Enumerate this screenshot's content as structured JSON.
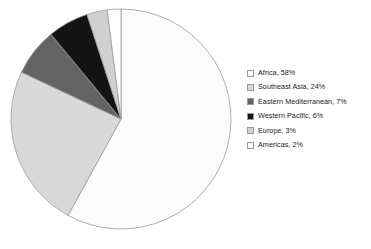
{
  "chart_data": {
    "type": "pie",
    "title": "",
    "subtitle": "",
    "xlabel": "",
    "ylabel": "",
    "legend_position": "right",
    "grid": false,
    "start_angle_deg": 0,
    "direction": "clockwise",
    "categories": [
      "Africa",
      "Southeast Asia",
      "Eastern Mediterranean",
      "Western Pacific",
      "Europe",
      "Americas"
    ],
    "values": [
      58,
      24,
      7,
      6,
      3,
      2
    ],
    "value_unit": "%",
    "slice_colors": [
      "#fbfbfb",
      "#d9d9d9",
      "#636363",
      "#141414",
      "#d0d0d0",
      "#ffffff"
    ],
    "slice_outline_color": "#9a9a9a",
    "slices": [
      {
        "label": "Africa",
        "value": 58,
        "display": "Africa, 58%",
        "color": "#fbfbfb"
      },
      {
        "label": "Southeast Asia",
        "value": 24,
        "display": "Southeast Asia, 24%",
        "color": "#d9d9d9"
      },
      {
        "label": "Eastern Mediterranean",
        "value": 7,
        "display": "Eastern Mediterranean, 7%",
        "color": "#636363"
      },
      {
        "label": "Western Pacific",
        "value": 6,
        "display": "Western Pacific, 6%",
        "color": "#141414"
      },
      {
        "label": "Europe",
        "value": 3,
        "display": "Europe, 3%",
        "color": "#d0d0d0"
      },
      {
        "label": "Americas",
        "value": 2,
        "display": "Americas, 2%",
        "color": "#ffffff"
      }
    ]
  },
  "legend": {
    "items": [
      {
        "label": "Africa, 58%",
        "color": "#fbfbfb"
      },
      {
        "label": "Southeast Asia, 24%",
        "color": "#d9d9d9"
      },
      {
        "label": "Eastern Mediterranean, 7%",
        "color": "#636363"
      },
      {
        "label": "Western Pacific, 6%",
        "color": "#141414"
      },
      {
        "label": "Europe, 3%",
        "color": "#d0d0d0"
      },
      {
        "label": "Americas, 2%",
        "color": "#ffffff"
      }
    ]
  },
  "geometry": {
    "center_x": 121,
    "center_y": 119,
    "radius": 110
  }
}
